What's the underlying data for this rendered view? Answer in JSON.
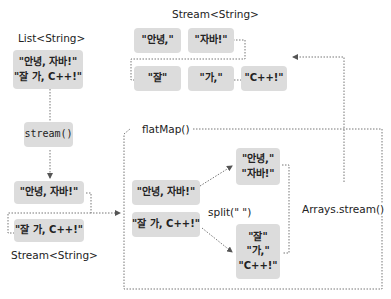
{
  "labels": {
    "list_type": "List<String>",
    "stream_top": "Stream<String>",
    "stream_bottom": "Stream<String>",
    "stream_method": "stream()",
    "flatmap": "flatMap()",
    "split": "split(\"  \")",
    "arrays_stream": "Arrays.stream()"
  },
  "list_box": {
    "line1": "\"안녕, 자바!\"",
    "line2": "\"잘 가, C++!\""
  },
  "stream_left": {
    "item1": "\"안녕, 자바!\"",
    "item2": "\"잘 가, C++!\""
  },
  "flatmap_inputs": {
    "item1": "\"안녕, 자바!\"",
    "item2": "\"잘 가, C++!\""
  },
  "split_results": {
    "group1": [
      "\"안녕,\"",
      "\"자바!\""
    ],
    "group2": [
      "\"잘\"",
      "\"가,\"",
      "\"C++!\""
    ]
  },
  "result_stream": {
    "row1": [
      "\"안녕,\"",
      "\"자바!\""
    ],
    "row2": [
      "\"잘\"",
      "\"가,\"",
      "\"C++!\""
    ]
  },
  "colors": {
    "box_fill": "#dcdcdc",
    "line": "#666666"
  }
}
